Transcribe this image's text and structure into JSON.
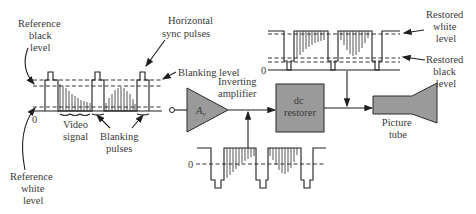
{
  "diagram": {
    "labels": {
      "reference_black": [
        "Reference",
        "black",
        "level"
      ],
      "horizontal_sync": [
        "Horizontal",
        "sync pulses"
      ],
      "blanking_level": "Blanking level",
      "zero_left": "0",
      "video_signal": [
        "Video",
        "signal"
      ],
      "blanking_pulses": [
        "Blanking",
        "pulses"
      ],
      "reference_white": [
        "Reference",
        "white",
        "level"
      ],
      "inverting_amplifier": [
        "Inverting",
        "amplifier"
      ],
      "amp_gain": "A",
      "amp_gain_sub": "v",
      "dc_restorer": [
        "dc",
        "restorer"
      ],
      "picture_tube": [
        "Picture",
        "tube"
      ],
      "restored_white": [
        "Restored",
        "white",
        "level"
      ],
      "restored_black": [
        "Restored",
        "black",
        "level"
      ],
      "zero_inverted": "0",
      "zero_restored": "0"
    },
    "colors": {
      "block_fill": "#9a9a9a",
      "line": "#1e1e1e",
      "text": "#3a3a3a"
    }
  }
}
